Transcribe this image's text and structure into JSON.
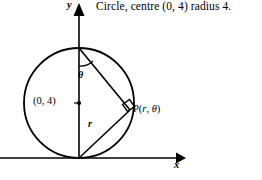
{
  "figure": {
    "caption": "Circle, centre (0, 4) radius 4.",
    "axes": {
      "y_label": "y",
      "x_label": "x",
      "origin": [
        79,
        158
      ],
      "y_axis_top": [
        79,
        5
      ],
      "x_axis_right": [
        180,
        158
      ]
    },
    "circle": {
      "centre_point": [
        79,
        103
      ],
      "radius_px": 55,
      "centre_label": "(0, 4)",
      "centre_coordinates": [
        0,
        4
      ],
      "radius_value": 4,
      "top_point": [
        79,
        48
      ]
    },
    "point_p": {
      "label_prefix": "P(",
      "label_r": "r",
      "label_sep": ", ",
      "label_theta": "θ",
      "label_suffix": ")",
      "position": [
        130,
        110
      ]
    },
    "angle": {
      "symbol": "θ",
      "vertex": [
        79,
        48
      ],
      "between": [
        "y-axis",
        "chord-to-P"
      ]
    },
    "segments": {
      "radius_label": "r",
      "from_origin_to_p": true,
      "chord_top_to_p": true,
      "right_angle_at_p": true
    }
  },
  "colors": {
    "ink": "#000000",
    "background": "#ffffff"
  }
}
